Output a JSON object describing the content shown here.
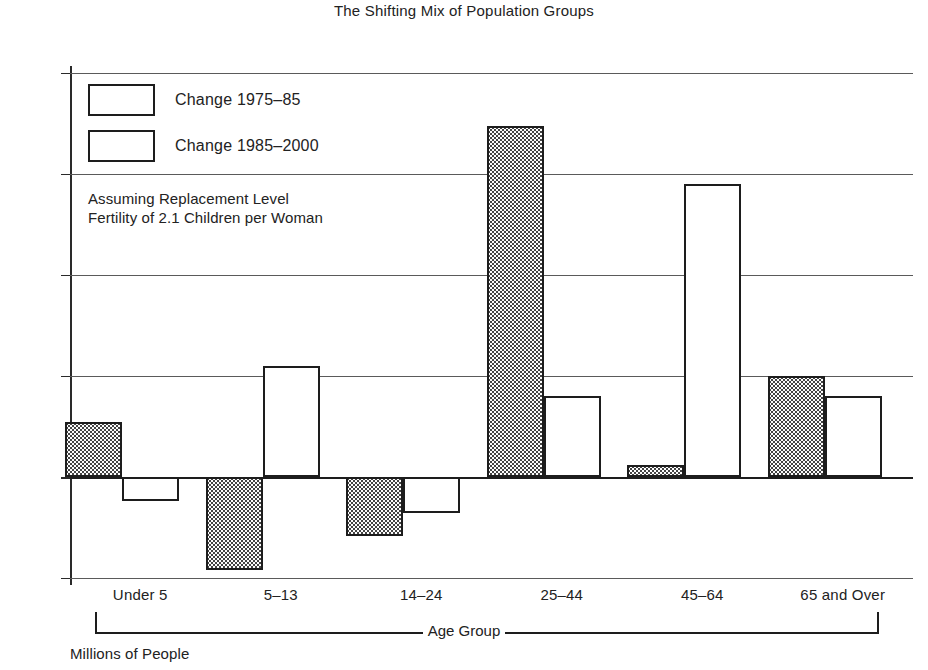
{
  "chart_data": {
    "type": "bar",
    "title": "The Shifting Mix of Population Groups",
    "xlabel": "Age Group",
    "ylabel": "Millions of People",
    "categories": [
      "Under 5",
      "5–13",
      "14–24",
      "25–44",
      "45–64",
      "65 and Over"
    ],
    "series": [
      {
        "name": "Change 1975–85",
        "fill": "stipple",
        "values": [
          2.7,
          -4.6,
          -2.9,
          17.4,
          0.6,
          5.0
        ]
      },
      {
        "name": "Change 1985–2000",
        "fill": "white",
        "values": [
          -1.2,
          5.5,
          -1.8,
          4.0,
          14.5,
          4.0
        ]
      }
    ],
    "ylim": [
      -5,
      20
    ],
    "yticks": [
      {
        "value": 20,
        "label": "+20"
      },
      {
        "value": 15,
        "label": "+15"
      },
      {
        "value": 10,
        "label": "+10"
      },
      {
        "value": 5,
        "label": "+5"
      },
      {
        "value": 0,
        "label": "0"
      },
      {
        "value": -5,
        "label": "−5"
      }
    ],
    "grid": true,
    "legend_position": "inside-top-left",
    "annotations": [
      "Assuming Replacement Level",
      "Fertility of 2.1 Children per Woman"
    ]
  },
  "colors": {
    "ink": "#1d1d1d",
    "grid": "#5a5a5a",
    "background": "#ffffff"
  }
}
